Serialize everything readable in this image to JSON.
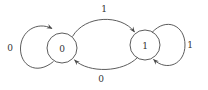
{
  "diagram": {
    "type": "finite-state-automaton",
    "colors": {
      "background": "#ffffff",
      "stroke": "#4a4a4a",
      "text": "#333333"
    },
    "states": [
      {
        "id": "q0",
        "label": "0"
      },
      {
        "id": "q1",
        "label": "1"
      }
    ],
    "transitions": [
      {
        "from": "q0",
        "to": "q0",
        "label": "0",
        "shape": "self-loop-left"
      },
      {
        "from": "q0",
        "to": "q1",
        "label": "1",
        "shape": "arc-top"
      },
      {
        "from": "q1",
        "to": "q1",
        "label": "1",
        "shape": "self-loop-right"
      },
      {
        "from": "q1",
        "to": "q0",
        "label": "0",
        "shape": "arc-bottom"
      }
    ]
  }
}
